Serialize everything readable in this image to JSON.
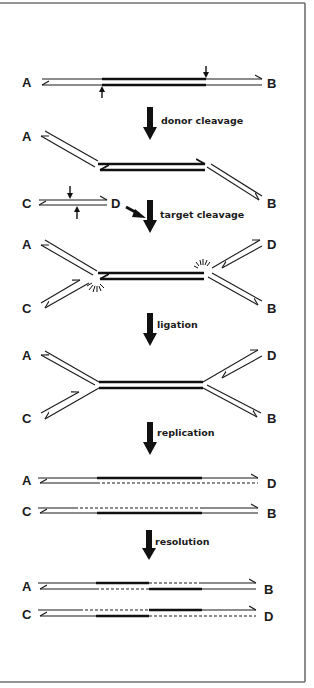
{
  "figure": {
    "steps": [
      {
        "id": "donor",
        "label": "donor cleavage"
      },
      {
        "id": "target",
        "label": "target cleavage"
      },
      {
        "id": "ligation",
        "label": "ligation"
      },
      {
        "id": "replication",
        "label": "replication"
      },
      {
        "id": "resolution",
        "label": "resolution"
      }
    ],
    "panels": {
      "p1": {
        "left": "A",
        "right": "B"
      },
      "p2": {
        "left": "A",
        "right": "B"
      },
      "target_dna": {
        "left": "C",
        "right": "D"
      },
      "p3": {
        "top_left": "A",
        "bottom_left": "C",
        "top_right": "D",
        "bottom_right": "B"
      },
      "p4": {
        "top_left": "A",
        "bottom_left": "C",
        "top_right": "D",
        "bottom_right": "B"
      },
      "p5": {
        "row1_left": "A",
        "row1_right": "D",
        "row2_left": "C",
        "row2_right": "B"
      },
      "p6": {
        "row1_left": "A",
        "row1_right": "B",
        "row2_left": "C",
        "row2_right": "D"
      }
    },
    "colors": {
      "ink": "#1a1a1a",
      "frame": "#707070",
      "background": "#ffffff"
    }
  }
}
